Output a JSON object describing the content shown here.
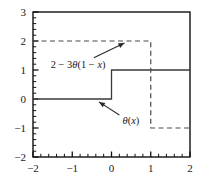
{
  "chart_data": {
    "type": "line",
    "title": "",
    "xlabel": "",
    "ylabel": "",
    "xlim": [
      -2,
      2
    ],
    "ylim": [
      -2,
      3
    ],
    "grid": false,
    "legend": "none",
    "x_ticks": [
      "-2",
      "-1",
      "0",
      "1",
      "2"
    ],
    "x_tick_values": [
      -2,
      -1,
      0,
      1,
      2
    ],
    "y_ticks": [
      "3",
      "2",
      "1",
      "0",
      "-1",
      "-2"
    ],
    "y_tick_values": [
      3,
      2,
      1,
      0,
      -1,
      -2
    ],
    "minor_tick_interval": 0.2,
    "series": [
      {
        "name": "theta(x)",
        "style": "solid",
        "color": "#3a3a3a",
        "points": [
          {
            "x": -2,
            "y": 0
          },
          {
            "x": 0,
            "y": 0
          },
          {
            "x": 0,
            "y": 1
          },
          {
            "x": 2,
            "y": 1
          }
        ]
      },
      {
        "name": "2-3theta(1-x)",
        "style": "dashed",
        "color": "#4a4a4a",
        "points": [
          {
            "x": -2,
            "y": 2
          },
          {
            "x": 1,
            "y": 2
          },
          {
            "x": 1,
            "y": -1
          },
          {
            "x": 2,
            "y": -1
          }
        ]
      }
    ],
    "annotations": [
      {
        "name": "2-3theta(1-x)",
        "text_parts": {
          "lead": "2 − 3",
          "theta": "θ",
          "open": "(1 − ",
          "var": "x",
          "close": ")"
        },
        "full_text": "2 − 3θ(1 − x)",
        "text_x": -1.55,
        "text_y": 1.22,
        "arrow_from": {
          "x": -0.45,
          "y": 1.42
        },
        "arrow_to": {
          "x": 0.33,
          "y": 1.93
        }
      },
      {
        "name": "theta(x)",
        "text_parts": {
          "lead": "",
          "theta": "θ",
          "open": "(",
          "var": "x",
          "close": ")"
        },
        "full_text": "θ(x)",
        "text_x": 0.28,
        "text_y": -0.72,
        "arrow_from": {
          "x": 0.2,
          "y": -0.55
        },
        "arrow_to": {
          "x": -0.32,
          "y": -0.1
        }
      }
    ]
  },
  "figure": {
    "axis_color": "#111111",
    "background": "#ffffff"
  }
}
